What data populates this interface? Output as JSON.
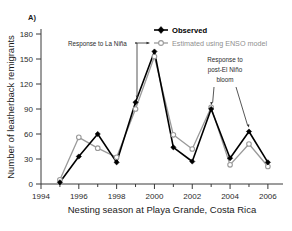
{
  "figure": {
    "panel_label": "A)",
    "background_color": "#ffffff"
  },
  "chart_data": {
    "type": "line",
    "title": "",
    "panel_label": "A)",
    "xlabel": "Nesting season at Playa Grande, Costa Rica",
    "ylabel": "Number of leatherback remigrants",
    "x": [
      1995,
      1996,
      1997,
      1998,
      1999,
      2000,
      2001,
      2002,
      2003,
      2004,
      2005,
      2006
    ],
    "xlim": [
      1994,
      2006.8
    ],
    "ylim": [
      0,
      186
    ],
    "xticks": [
      1994,
      1996,
      1998,
      2000,
      2002,
      2004,
      2006
    ],
    "xtick_labels": [
      "1994",
      "1996",
      "1998",
      "2000",
      "2002",
      "2004",
      "2006"
    ],
    "xminor_ticks": [
      1995,
      1997,
      1999,
      2001,
      2003,
      2005
    ],
    "yticks": [
      0,
      30,
      60,
      90,
      120,
      150,
      180
    ],
    "ytick_labels": [
      "0",
      "30",
      "60",
      "90",
      "120",
      "150",
      "180"
    ],
    "grid": false,
    "legend_position": "top-right",
    "series": [
      {
        "name": "Observed",
        "color": "#000000",
        "marker": "filled-diamond",
        "values": [
          2,
          33,
          60,
          26,
          98,
          159,
          44,
          27,
          90,
          31,
          63,
          26
        ]
      },
      {
        "name": "Estimated using ENSO model",
        "color": "#9a9a9a",
        "marker": "open-circle",
        "values": [
          5,
          56,
          43,
          32,
          90,
          153,
          59,
          42,
          92,
          23,
          48,
          21
        ]
      }
    ],
    "annotations": [
      {
        "id": "la-nina",
        "text": "Response to La Niña",
        "lines": [
          "Response to La Niña"
        ],
        "points_to": [
          {
            "x": 2000,
            "y": 159
          },
          {
            "x": 1999,
            "y": 98
          }
        ]
      },
      {
        "id": "post-el-nino-bloom",
        "text": "Response to post-El Niño bloom",
        "lines": [
          "Response to",
          "post-El Niño",
          "bloom"
        ],
        "points_to": [
          {
            "x": 2003,
            "y": 90
          },
          {
            "x": 2005,
            "y": 63
          }
        ]
      }
    ]
  },
  "legend": {
    "items": [
      {
        "label": "Observed",
        "color": "#000000"
      },
      {
        "label": "Estimated using ENSO model",
        "color": "#9a9a9a"
      }
    ]
  },
  "axes": {
    "x_title": "Nesting season at Playa Grande, Costa Rica",
    "y_title": "Number of leatherback remigrants"
  },
  "annotation_texts": {
    "la_nina": "Response to La Niña",
    "bloom_line1": "Response to",
    "bloom_line2": "post-El Niño",
    "bloom_line3": "bloom"
  }
}
